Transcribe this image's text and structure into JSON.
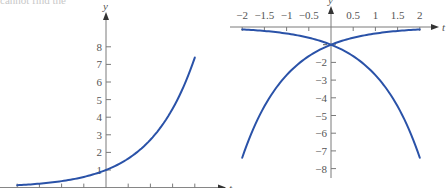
{
  "top_fragment": "cannot find the",
  "chart_data": [
    {
      "type": "line",
      "title": "",
      "xlabel": "t",
      "ylabel": "y",
      "xlim": [
        -2,
        2
      ],
      "ylim": [
        0,
        8
      ],
      "x_ticks": [
        -2,
        -1.5,
        -1,
        -0.5,
        0,
        0.5,
        1,
        1.5,
        2
      ],
      "y_ticks": [
        1,
        2,
        3,
        4,
        5,
        6,
        7,
        8
      ],
      "y_tick_labels": [
        "1",
        "2",
        "3",
        "4",
        "5",
        "6",
        "7",
        "8"
      ],
      "grid": false,
      "series": [
        {
          "name": "y = e^t",
          "color": "#2a52a8",
          "x": [
            -2,
            -1.5,
            -1,
            -0.5,
            0,
            0.5,
            1,
            1.5,
            2
          ],
          "values": [
            0.135,
            0.223,
            0.368,
            0.607,
            1,
            1.649,
            2.718,
            4.482,
            7.389
          ]
        }
      ]
    },
    {
      "type": "line",
      "title": "",
      "xlabel": "t",
      "ylabel": "y",
      "xlim": [
        -2,
        2
      ],
      "ylim": [
        -8,
        0
      ],
      "x_ticks": [
        -2,
        -1.5,
        -1,
        -0.5,
        0.5,
        1,
        1.5,
        2
      ],
      "x_tick_labels": [
        "−2",
        "−1.5",
        "−1",
        "−0.5",
        "0.5",
        "1",
        "1.5",
        "2"
      ],
      "y_ticks": [
        -1,
        -2,
        -3,
        -4,
        -5,
        -6,
        -7,
        -8
      ],
      "y_tick_labels": [
        "",
        "−2",
        "−3",
        "−4",
        "−5",
        "−6",
        "−7",
        "−8"
      ],
      "grid": false,
      "series": [
        {
          "name": "y = −e^t",
          "color": "#2a52a8",
          "x": [
            -2,
            -1.5,
            -1,
            -0.5,
            0,
            0.5,
            1,
            1.5,
            2
          ],
          "values": [
            -0.135,
            -0.223,
            -0.368,
            -0.607,
            -1,
            -1.649,
            -2.718,
            -4.482,
            -7.389
          ]
        },
        {
          "name": "y = −e^(−t)",
          "color": "#2a52a8",
          "x": [
            -2,
            -1.5,
            -1,
            -0.5,
            0,
            0.5,
            1,
            1.5,
            2
          ],
          "values": [
            -7.389,
            -4.482,
            -2.718,
            -1.649,
            -1,
            -0.607,
            -0.368,
            -0.223,
            -0.135
          ]
        }
      ]
    }
  ]
}
